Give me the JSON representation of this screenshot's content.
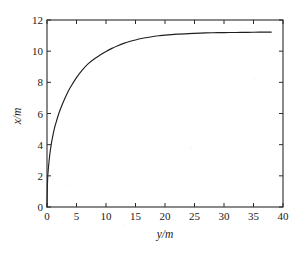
{
  "chart_data": {
    "type": "line",
    "title": "",
    "xlabel": "y/m",
    "ylabel": "x/m",
    "xlim": [
      0,
      40
    ],
    "ylim": [
      0,
      12
    ],
    "xticks": [
      0,
      5,
      10,
      15,
      20,
      25,
      30,
      35,
      40
    ],
    "yticks": [
      0,
      2,
      4,
      6,
      8,
      10,
      12
    ],
    "xtick_labels": [
      "0",
      "5",
      "10",
      "15",
      "20",
      "25",
      "30",
      "35",
      "40"
    ],
    "ytick_labels": [
      "0",
      "2",
      "4",
      "6",
      "8",
      "10",
      "12"
    ],
    "grid": false,
    "legend": null,
    "line_color": "#1f1f1f",
    "background_color": "#ffffff",
    "series": [
      {
        "name": "x(y)",
        "x": [
          0.0,
          0.1,
          0.25,
          0.5,
          0.8,
          1.2,
          1.6,
          2.0,
          2.5,
          3.0,
          3.5,
          4.0,
          5.0,
          6.0,
          7.0,
          8.0,
          9.0,
          10.0,
          11.0,
          12.0,
          13.0,
          14.0,
          15.0,
          16.0,
          17.0,
          18.0,
          19.0,
          20.0,
          22.0,
          24.0,
          26.0,
          28.0,
          30.0,
          32.0,
          34.0,
          36.0,
          38.0
        ],
        "y": [
          0.0,
          1.75,
          2.55,
          3.45,
          4.2,
          4.95,
          5.5,
          6.0,
          6.5,
          6.95,
          7.35,
          7.7,
          8.3,
          8.8,
          9.2,
          9.5,
          9.75,
          9.98,
          10.18,
          10.35,
          10.5,
          10.62,
          10.72,
          10.81,
          10.88,
          10.94,
          10.99,
          11.03,
          11.09,
          11.13,
          11.16,
          11.18,
          11.19,
          11.2,
          11.21,
          11.22,
          11.22
        ]
      }
    ],
    "asymptote": 11.22
  },
  "axes": {
    "x_axis_label": "y/m",
    "y_axis_label": "x/m"
  }
}
